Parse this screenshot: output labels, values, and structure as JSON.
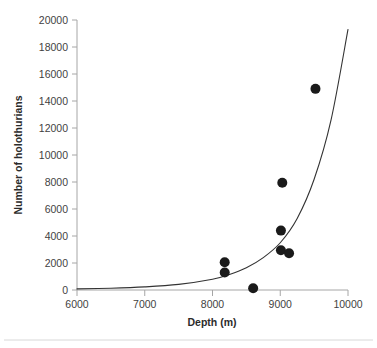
{
  "chart_data": {
    "type": "scatter",
    "title": "",
    "xlabel": "Depth (m)",
    "ylabel": "Number of holothurians",
    "xlim": [
      6000,
      10000
    ],
    "ylim": [
      0,
      20000
    ],
    "xticks": [
      6000,
      7000,
      8000,
      9000,
      10000
    ],
    "yticks": [
      0,
      2000,
      4000,
      6000,
      8000,
      10000,
      12000,
      14000,
      16000,
      18000,
      20000
    ],
    "xtick_labels": [
      "6000",
      "7000",
      "8000",
      "9000",
      "10000"
    ],
    "ytick_labels": [
      "0",
      "2000",
      "4000",
      "6000",
      "8000",
      "10000",
      "12000",
      "14000",
      "16000",
      "18000",
      "20000"
    ],
    "grid": false,
    "legend": false,
    "legend_position": "none",
    "marker_color": "#1a1a1a",
    "marker_size": 5,
    "points": [
      {
        "x": 8180,
        "y": 2050
      },
      {
        "x": 8180,
        "y": 1300
      },
      {
        "x": 8600,
        "y": 130
      },
      {
        "x": 9030,
        "y": 7950
      },
      {
        "x": 9010,
        "y": 4400
      },
      {
        "x": 9010,
        "y": 2950
      },
      {
        "x": 9130,
        "y": 2720
      },
      {
        "x": 9520,
        "y": 14900
      }
    ],
    "series": [
      {
        "name": "holothurian counts",
        "x": [
          8180,
          8180,
          8600,
          9030,
          9010,
          9010,
          9130,
          9520
        ],
        "values": [
          2050,
          1300,
          130,
          7950,
          4400,
          2950,
          2720,
          14900
        ]
      }
    ],
    "fit_curve": {
      "type": "exponential",
      "color": "#333333",
      "x_start": 6000,
      "x_end": 10000,
      "y_start": 80,
      "y_end": 19300,
      "points": [
        {
          "x": 6000,
          "y": 80
        },
        {
          "x": 6500,
          "y": 130
        },
        {
          "x": 7000,
          "y": 230
        },
        {
          "x": 7500,
          "y": 420
        },
        {
          "x": 8000,
          "y": 800
        },
        {
          "x": 8250,
          "y": 1150
        },
        {
          "x": 8500,
          "y": 1650
        },
        {
          "x": 8750,
          "y": 2400
        },
        {
          "x": 9000,
          "y": 3500
        },
        {
          "x": 9250,
          "y": 5300
        },
        {
          "x": 9500,
          "y": 8200
        },
        {
          "x": 9750,
          "y": 12600
        },
        {
          "x": 10000,
          "y": 19300
        }
      ]
    }
  },
  "figure": {
    "background_color": "#ffffff",
    "axis_color": "#a6a6a6",
    "text_color": "#3b3b3b",
    "rule_color": "#d8d8d8"
  }
}
